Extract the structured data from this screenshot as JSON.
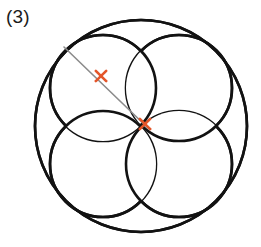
{
  "figure": {
    "label": "(3)",
    "caption": "",
    "background_color": "#ffffff",
    "stroke_color": "#121212",
    "marker_color": "#e4562a",
    "line_color": "#8c8c8c",
    "width": 261,
    "height": 247
  },
  "chart_data": {
    "type": "diagram",
    "title": "(3)",
    "outer_circle": {
      "name": "outer-circle",
      "cx": 141,
      "cy": 126,
      "r": 106,
      "stroke": "#121212",
      "stroke_width": 2.6,
      "fill": "none"
    },
    "inner_circles": [
      {
        "name": "inner-circle-top-left",
        "cx": 103,
        "cy": 88,
        "r": 53,
        "stroke": "#121212",
        "stroke_width": 2.6,
        "fill": "none"
      },
      {
        "name": "inner-circle-top-right",
        "cx": 179,
        "cy": 88,
        "r": 53,
        "stroke": "#121212",
        "stroke_width": 2.6,
        "fill": "none"
      },
      {
        "name": "inner-circle-bottom-right",
        "cx": 179,
        "cy": 164,
        "r": 53,
        "stroke": "#121212",
        "stroke_width": 2.6,
        "fill": "none"
      },
      {
        "name": "inner-circle-bottom-left",
        "cx": 103,
        "cy": 164,
        "r": 53,
        "stroke": "#121212",
        "stroke_width": 2.6,
        "fill": "none"
      }
    ],
    "segment": {
      "name": "radius-segment",
      "x1": 64,
      "y1": 47,
      "x2": 149,
      "y2": 129,
      "stroke": "#8c8c8c",
      "stroke_width": 1.6
    },
    "markers": [
      {
        "name": "x-marker-outer",
        "x": 101,
        "y": 76,
        "size": 5.2,
        "color": "#e4562a",
        "stroke_width": 2.6,
        "label": ""
      },
      {
        "name": "x-marker-centre",
        "x": 145,
        "y": 124,
        "size": 5.2,
        "color": "#e4562a",
        "stroke_width": 2.6,
        "label": ""
      }
    ],
    "axis_labels": [],
    "legend": [],
    "annotations": [
      {
        "name": "figure-number",
        "text": "(3)",
        "x": 8,
        "y": 24
      }
    ],
    "grid": false,
    "legend_position": "none"
  }
}
